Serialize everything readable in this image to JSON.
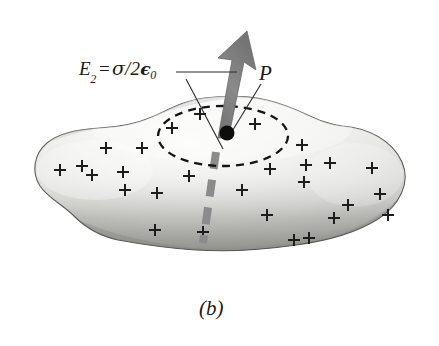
{
  "figure": {
    "caption": "(b)",
    "labels": {
      "field_label": {
        "symbol": "E",
        "subscript": "2",
        "equals": "=",
        "sigma": "σ",
        "slash": "/",
        "two": "2",
        "epsilon": "ϵ",
        "epsilon_subscript": "0",
        "full_text": "E2 = σ/2ϵ0"
      },
      "point_label": "P"
    },
    "colors": {
      "background": "#ffffff",
      "blob_light": "#f2f2f0",
      "blob_mid": "#d8d8d6",
      "blob_edge": "#6e6e6e",
      "arrow_gray": "#808080",
      "dashed_thick_gray": "#8a8a8a",
      "outline_black": "#111111",
      "text_black": "#1a1a1a"
    },
    "charge_symbols": {
      "glyph": "+",
      "count": 28,
      "description": "positive surface charge marks distributed over the conductor slab"
    },
    "elements": {
      "blob_name": "charged-conductor-slab",
      "gaussian_name": "dashed-gaussian-ellipse",
      "arrow_name": "electric-field-arrow",
      "point_name": "field-point-dot",
      "dashed_line_name": "thick-dashed-normal-line"
    }
  }
}
